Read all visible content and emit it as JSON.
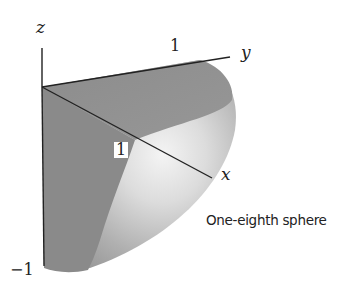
{
  "figure": {
    "caption": "One-eighth sphere",
    "axes": {
      "x": {
        "label": "x",
        "tick": "1"
      },
      "y": {
        "label": "y",
        "tick": "1"
      },
      "z": {
        "label": "z",
        "tick": "−1"
      }
    },
    "colors": {
      "flat_face": "#8a8a8a",
      "top_face": "#8f8f8f",
      "curved_surface_dark": "#9a9a9a",
      "curved_surface_highlight": "#f2f2f2",
      "axis_line": "#222222",
      "background": "#ffffff"
    }
  }
}
